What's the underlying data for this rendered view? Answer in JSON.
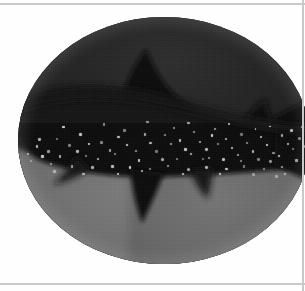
{
  "page": {
    "background_color": "#fefefe",
    "width": 305,
    "height": 291
  },
  "rules": {
    "color": "#c9c9c9",
    "top_label": "page rule top",
    "bottom_label": "page rule bottom",
    "right_label": "page rule right"
  },
  "plate": {
    "caption": "",
    "alt_text": "Whale shark photographed from the side in dark water, shown within an oval vignette",
    "shape": "oval",
    "subject": "whale shark",
    "water_color_dark": "#222222",
    "water_color_light": "#6f6f6f",
    "body_color": "#121212",
    "spot_color": "#cfcfcf",
    "spot_count": 96
  },
  "spots": [
    [
      13,
      49
    ],
    [
      17,
      51.5
    ],
    [
      10,
      54
    ],
    [
      14,
      56
    ],
    [
      20,
      54
    ],
    [
      24,
      51
    ],
    [
      23,
      56
    ],
    [
      28,
      50
    ],
    [
      31,
      53.5
    ],
    [
      27,
      57
    ],
    [
      34,
      48
    ],
    [
      37,
      51.5
    ],
    [
      33,
      55
    ],
    [
      40,
      54
    ],
    [
      43,
      47
    ],
    [
      45,
      50.5
    ],
    [
      41,
      57.5
    ],
    [
      47,
      54
    ],
    [
      50,
      47.5
    ],
    [
      52,
      51
    ],
    [
      49,
      57
    ],
    [
      55,
      49.5
    ],
    [
      57,
      53
    ],
    [
      54,
      57
    ],
    [
      60,
      46
    ],
    [
      62,
      50
    ],
    [
      59,
      55
    ],
    [
      64,
      53
    ],
    [
      66,
      47.5
    ],
    [
      68,
      51
    ],
    [
      65,
      56.5
    ],
    [
      71,
      49
    ],
    [
      73,
      52.5
    ],
    [
      70,
      57
    ],
    [
      76,
      47
    ],
    [
      78,
      50.5
    ],
    [
      75,
      55.5
    ],
    [
      80,
      54
    ],
    [
      83,
      48
    ],
    [
      85,
      51.5
    ],
    [
      82,
      57
    ],
    [
      87,
      54.5
    ],
    [
      90,
      47.5
    ],
    [
      92,
      51
    ],
    [
      89,
      56
    ],
    [
      94,
      53
    ],
    [
      96,
      48.5
    ],
    [
      98,
      52
    ],
    [
      95,
      57.5
    ],
    [
      6,
      52
    ],
    [
      8,
      56
    ],
    [
      4,
      58
    ],
    [
      11,
      59
    ],
    [
      18,
      60
    ],
    [
      25,
      60.5
    ],
    [
      32,
      60
    ],
    [
      38,
      60.5
    ],
    [
      45,
      61
    ],
    [
      51,
      60
    ],
    [
      58,
      61
    ],
    [
      64,
      60.5
    ],
    [
      71,
      61
    ],
    [
      77,
      60
    ],
    [
      84,
      61
    ],
    [
      90,
      60.5
    ],
    [
      3,
      55
    ],
    [
      7,
      49
    ],
    [
      21,
      47
    ],
    [
      36,
      45.5
    ],
    [
      53,
      44.5
    ],
    [
      67,
      45
    ],
    [
      81,
      45
    ],
    [
      93,
      45.5
    ],
    [
      15,
      44
    ],
    [
      29,
      43
    ],
    [
      44,
      42
    ],
    [
      58,
      42.5
    ],
    [
      72,
      43
    ],
    [
      86,
      44
    ],
    [
      99,
      50
    ],
    [
      101,
      54
    ],
    [
      97,
      44
    ],
    [
      42,
      62
    ],
    [
      56,
      63
    ],
    [
      69,
      63
    ],
    [
      80,
      63
    ],
    [
      88,
      64
    ],
    [
      12,
      62
    ],
    [
      22,
      63
    ],
    [
      34,
      63
    ],
    [
      63,
      57
    ],
    [
      76,
      58
    ],
    [
      86,
      58
    ],
    [
      91,
      63
    ],
    [
      99,
      60
    ]
  ]
}
